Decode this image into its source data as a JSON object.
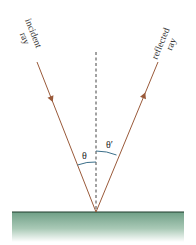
{
  "diagram": {
    "labels": {
      "incident_line1": "incident",
      "incident_line2": "ray",
      "reflected_line1": "reflected",
      "reflected_line2": "ray",
      "angle_incidence": "θ",
      "angle_reflection": "θ′"
    },
    "colors": {
      "ray": "#9a5a3a",
      "normal": "#444444",
      "angle_arc": "#3b6f8a",
      "surface_line": "#1f3d2c",
      "surface_fill_top": "#6f9f86",
      "surface_fill_bottom": "#ffffff"
    },
    "elements": {
      "incident_ray": {
        "direction": "toward-surface",
        "arrow": true
      },
      "reflected_ray": {
        "direction": "away-from-surface",
        "arrow": true
      },
      "normal": {
        "style": "dashed"
      },
      "surface": {
        "style": "mirror"
      }
    }
  }
}
